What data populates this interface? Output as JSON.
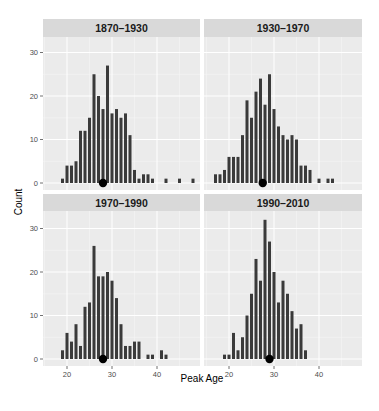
{
  "chart_data": {
    "type": "bar",
    "subtype": "faceted histogram (bin width 1 year) with median point",
    "title": "",
    "xlabel": "Peak Age",
    "ylabel": "Count",
    "xlim": [
      15,
      50
    ],
    "ylim": [
      0,
      35
    ],
    "x_ticks": [
      20,
      30,
      40
    ],
    "y_ticks": [
      0,
      10,
      20,
      30
    ],
    "grid": true,
    "legend": "none",
    "colors": {
      "bar": "#3a3a3a",
      "panel_bg": "#ebebeb",
      "grid": "#ffffff",
      "strip_bg": "#d9d9d9",
      "median_point": "#000000"
    },
    "facets": [
      {
        "label": "1870–1930",
        "x": [
          19,
          20,
          21,
          22,
          23,
          24,
          25,
          26,
          27,
          28,
          29,
          30,
          31,
          32,
          33,
          34,
          35,
          36,
          37,
          38,
          39,
          42,
          45,
          48
        ],
        "values": [
          1,
          4,
          4,
          5,
          12,
          12,
          15,
          25,
          20,
          17,
          27,
          16,
          17,
          15,
          16,
          11,
          3,
          1,
          2,
          2,
          1,
          1,
          1,
          1
        ],
        "median_marker": 28
      },
      {
        "label": "1930–1970",
        "x": [
          17,
          18,
          19,
          20,
          21,
          22,
          23,
          24,
          25,
          26,
          27,
          28,
          29,
          30,
          31,
          32,
          33,
          34,
          35,
          36,
          37,
          38,
          40,
          42,
          43
        ],
        "values": [
          2,
          2,
          3,
          6,
          6,
          6,
          11,
          19,
          15,
          21,
          24,
          18,
          25,
          17,
          13,
          11,
          10,
          11,
          10,
          4,
          4,
          3,
          1,
          1,
          1
        ],
        "median_marker": 27.5
      },
      {
        "label": "1970–1990",
        "x": [
          19,
          20,
          21,
          22,
          23,
          24,
          25,
          26,
          27,
          28,
          29,
          30,
          31,
          32,
          33,
          34,
          35,
          36,
          38,
          39,
          41,
          42
        ],
        "values": [
          2,
          6,
          4,
          8,
          3,
          12,
          13,
          26,
          19,
          19,
          20,
          18,
          14,
          8,
          3,
          3,
          4,
          4,
          1,
          1,
          2,
          1
        ],
        "median_marker": 28
      },
      {
        "label": "1990–2010",
        "x": [
          19,
          20,
          21,
          22,
          23,
          24,
          25,
          26,
          27,
          28,
          29,
          30,
          31,
          32,
          33,
          34,
          35,
          36,
          37
        ],
        "values": [
          1,
          1,
          6,
          2,
          5,
          10,
          15,
          23,
          18,
          32,
          27,
          20,
          13,
          18,
          15,
          11,
          7,
          8,
          2
        ],
        "median_marker": 29
      }
    ]
  }
}
